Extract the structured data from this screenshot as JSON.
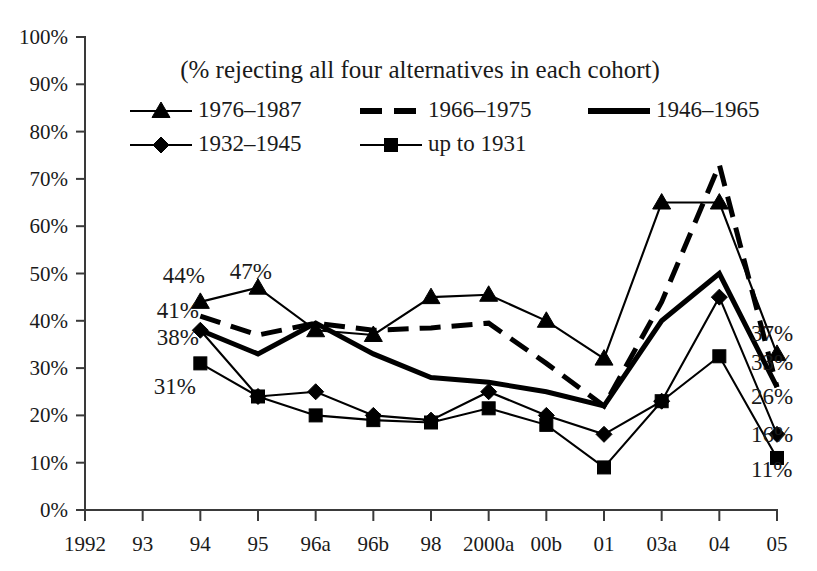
{
  "chart_data": {
    "type": "line",
    "title": "(% rejecting all four alternatives in each cohort)",
    "xlabel": "",
    "ylabel": "",
    "ylim": [
      0,
      100
    ],
    "grid": false,
    "legend_position": "top-inside",
    "categories": [
      "1992",
      "93",
      "94",
      "95",
      "96a",
      "96b",
      "98",
      "2000a",
      "00b",
      "01",
      "03a",
      "04",
      "05"
    ],
    "y_ticks": [
      "0%",
      "10%",
      "20%",
      "30%",
      "40%",
      "50%",
      "60%",
      "70%",
      "80%",
      "90%",
      "100%"
    ],
    "y_tick_values": [
      0,
      10,
      20,
      30,
      40,
      50,
      60,
      70,
      80,
      90,
      100
    ],
    "series": [
      {
        "name": "1976–1987",
        "marker": "triangle",
        "style": "thin",
        "values": [
          null,
          null,
          44,
          47,
          38,
          37,
          45,
          45.5,
          40,
          32,
          65,
          65,
          33
        ]
      },
      {
        "name": "1966–1975",
        "marker": "none",
        "style": "dashed",
        "values": [
          null,
          null,
          41,
          37,
          39.5,
          38,
          38.5,
          39.5,
          31,
          22,
          44,
          73,
          26
        ]
      },
      {
        "name": "1946–1965",
        "marker": "none",
        "style": "heavy",
        "values": [
          null,
          null,
          38,
          33,
          39.5,
          33,
          28,
          27,
          25,
          22,
          40,
          50,
          26
        ]
      },
      {
        "name": "1932–1945",
        "marker": "diamond",
        "style": "thin",
        "values": [
          null,
          null,
          38,
          24,
          25,
          20,
          19,
          25,
          20,
          16,
          23,
          45,
          16
        ]
      },
      {
        "name": "up to 1931",
        "marker": "square",
        "style": "thin",
        "values": [
          null,
          null,
          31,
          24,
          20,
          19,
          18.5,
          21.5,
          18,
          9,
          23,
          32.5,
          11
        ]
      }
    ],
    "point_labels_left": [
      {
        "text": "44%",
        "series": "1976–1987",
        "category": "94",
        "value": 44
      },
      {
        "text": "47%",
        "series": "1976–1987",
        "category": "95",
        "value": 47
      },
      {
        "text": "41%",
        "series": "1966–1975",
        "category": "94",
        "value": 41
      },
      {
        "text": "38%",
        "series": "1946–1965",
        "category": "94",
        "value": 38
      },
      {
        "text": "31%",
        "series": "up to 1931",
        "category": "94",
        "value": 31
      }
    ],
    "point_labels_right": [
      {
        "text": "37%",
        "series": "1966–1975",
        "category": "05",
        "value": 37
      },
      {
        "text": "33%",
        "series": "1976–1987",
        "category": "05",
        "value": 33
      },
      {
        "text": "26%",
        "series": "1946–1965",
        "category": "05",
        "value": 26
      },
      {
        "text": "16%",
        "series": "1932–1945",
        "category": "05",
        "value": 16
      },
      {
        "text": "11%",
        "series": "up to 1931",
        "category": "05",
        "value": 11
      }
    ],
    "colors": {
      "line": "#000000",
      "axis": "#3a3a3a",
      "text": "#1a1a1a",
      "background": "#ffffff"
    }
  },
  "legend": {
    "entries": [
      {
        "label": "1976–1987",
        "marker": "triangle",
        "style": "thin"
      },
      {
        "label": "1966–1975",
        "marker": "none",
        "style": "dashed"
      },
      {
        "label": "1946–1965",
        "marker": "none",
        "style": "heavy"
      },
      {
        "label": "1932–1945",
        "marker": "diamond",
        "style": "thin"
      },
      {
        "label": "up to 1931",
        "marker": "square",
        "style": "thin"
      }
    ]
  }
}
